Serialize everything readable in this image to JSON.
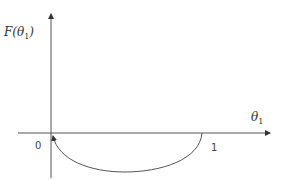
{
  "diagram": {
    "y_axis_label_main": "F(θ",
    "y_axis_label_sub": "1",
    "y_axis_label_close": ")",
    "x_axis_label_main": "θ",
    "x_axis_label_sub": "1",
    "origin_label": "0",
    "x_tick_label": "1",
    "curve": {
      "description": "Curve from (1,0) dipping below axis and returning to origin with arrow at origin",
      "start": [
        1,
        0
      ],
      "end": [
        0,
        0
      ],
      "min_below_axis": true
    },
    "colors": {
      "axis": "#555555",
      "curve": "#555555",
      "text": "#333333"
    }
  }
}
